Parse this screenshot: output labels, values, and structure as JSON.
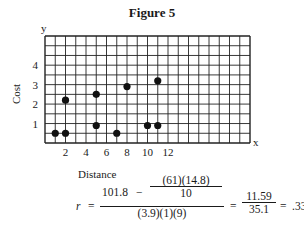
{
  "figure": {
    "title": "Figure 5",
    "x_axis_letter": "x",
    "y_axis_letter": "y",
    "xlabel": "Distance",
    "ylabel": "Cost"
  },
  "formula": {
    "lhs": "r",
    "eq": "=",
    "num_main": "101.8",
    "minus": "−",
    "inner_num": "(61)(14.8)",
    "inner_den": "10",
    "den": "(3.9)(1)(9)",
    "result_num": "11.59",
    "result_den": "35.1",
    "result": ".33"
  },
  "chart_data": {
    "type": "scatter",
    "title": "Figure 5",
    "xlabel": "Distance",
    "ylabel": "Cost",
    "x_ticks": [
      2,
      4,
      6,
      8,
      10,
      12
    ],
    "y_ticks": [
      1,
      2,
      3,
      4
    ],
    "xlim": [
      0,
      20
    ],
    "ylim": [
      0,
      5.5
    ],
    "grid": true,
    "points": [
      {
        "x": 1,
        "y": 0.5
      },
      {
        "x": 2,
        "y": 0.5
      },
      {
        "x": 2,
        "y": 2.2
      },
      {
        "x": 5,
        "y": 0.9
      },
      {
        "x": 5,
        "y": 2.5
      },
      {
        "x": 7,
        "y": 0.5
      },
      {
        "x": 8,
        "y": 2.9
      },
      {
        "x": 10,
        "y": 0.9
      },
      {
        "x": 11,
        "y": 0.9
      },
      {
        "x": 11,
        "y": 3.2
      }
    ],
    "annotation": "r = [101.8 − (61)(14.8)/10] / [(3.9)(1)(9)] = 11.59/35.1 = .33"
  }
}
